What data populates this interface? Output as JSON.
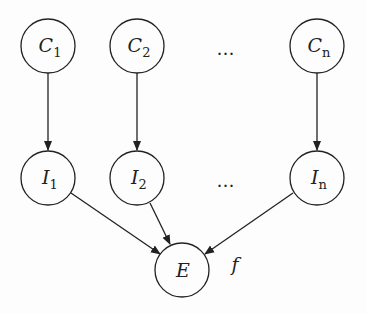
{
  "diagram": {
    "nodes": {
      "c1": {
        "base": "C",
        "sub": "1"
      },
      "c2": {
        "base": "C",
        "sub": "2"
      },
      "cn": {
        "base": "C",
        "sub": "n"
      },
      "i1": {
        "base": "I",
        "sub": "1"
      },
      "i2": {
        "base": "I",
        "sub": "2"
      },
      "in": {
        "base": "I",
        "sub": "n"
      },
      "e": {
        "base": "E",
        "sub": ""
      }
    },
    "ellipsis_top": "…",
    "ellipsis_mid": "…",
    "function_label": "f",
    "edges": [
      [
        "C1",
        "I1"
      ],
      [
        "C2",
        "I2"
      ],
      [
        "Cn",
        "In"
      ],
      [
        "I1",
        "E"
      ],
      [
        "I2",
        "E"
      ],
      [
        "In",
        "E"
      ]
    ]
  }
}
